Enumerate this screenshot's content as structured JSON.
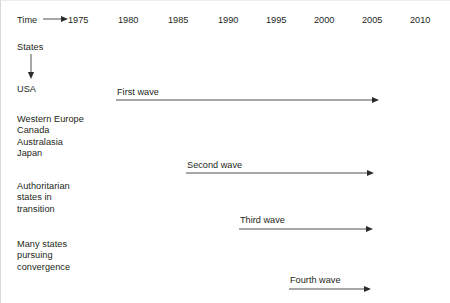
{
  "figure": {
    "axis_label": "Time",
    "row_axis_label": "States",
    "years": [
      "1975",
      "1980",
      "1985",
      "1990",
      "1995",
      "2000",
      "2005",
      "2010"
    ],
    "year_x": [
      67,
      117,
      167,
      217,
      265,
      313,
      361,
      409
    ],
    "stroke_color": "#3a3a3a",
    "text_color": "#231f20",
    "background": "#ffffff"
  },
  "rows": [
    {
      "name": "usa",
      "label": "USA",
      "top": 83
    },
    {
      "name": "western-europe-group",
      "label": "Western Europe\nCanada\nAustralasia\nJapan",
      "top": 113
    },
    {
      "name": "authoritarian-group",
      "label": "Authoritarian\nstates in\ntransition",
      "top": 180
    },
    {
      "name": "many-states-group",
      "label": "Many states\npursuing\nconvergence",
      "top": 238
    }
  ],
  "waves": [
    {
      "name": "first-wave",
      "label": "First wave",
      "label_x": 116,
      "label_y": 86,
      "line_y": 99,
      "x1": 115,
      "x2": 378
    },
    {
      "name": "second-wave",
      "label": "Second wave",
      "label_x": 186,
      "label_y": 159,
      "line_y": 172,
      "x1": 185,
      "x2": 373
    },
    {
      "name": "third-wave",
      "label": "Third wave",
      "label_x": 239,
      "label_y": 214,
      "line_y": 228,
      "x1": 238,
      "x2": 372
    },
    {
      "name": "fourth-wave",
      "label": "Fourth wave",
      "label_x": 289,
      "label_y": 274,
      "line_y": 288,
      "x1": 288,
      "x2": 370
    }
  ],
  "time_arrow": {
    "x1": 42,
    "x2": 62,
    "y": 18
  },
  "states_arrow": {
    "x": 30,
    "y1": 53,
    "y2": 78
  }
}
